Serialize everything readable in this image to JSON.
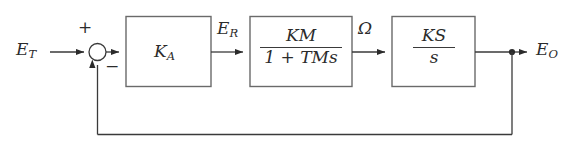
{
  "diagram": {
    "type": "control-system-block-diagram",
    "background_color": "#ffffff",
    "line_color": "#3a3a3a",
    "text_color": "#2b2b2b",
    "signals": {
      "input": {
        "base": "E",
        "sub": "T",
        "text": "E_T"
      },
      "after_amplifier": {
        "base": "E",
        "sub": "R",
        "text": "E_R"
      },
      "after_motor": {
        "base": "Ω",
        "sub": "",
        "text": "Ω"
      },
      "output": {
        "base": "E",
        "sub": "O",
        "text": "E_O"
      }
    },
    "summing_junction": {
      "name": "summing-junction",
      "plus_sign": "+",
      "minus_sign": "−"
    },
    "blocks": [
      {
        "id": "amplifier",
        "kind": "gain",
        "base": "K",
        "sub": "A",
        "text": "K_A"
      },
      {
        "id": "motor",
        "kind": "transfer-function",
        "numerator_base": "K",
        "numerator_sub": "M",
        "numerator_text": "K_M",
        "denominator_text": "1 + T_M s",
        "denominator_lead": "1 + T",
        "denominator_sub": "M",
        "denominator_tail": "s"
      },
      {
        "id": "integrator",
        "kind": "transfer-function",
        "numerator_base": "K",
        "numerator_sub": "S",
        "numerator_text": "K_S",
        "denominator_text": "s"
      }
    ],
    "feedback": {
      "name": "unity-feedback-path",
      "description": "output tapped and returned to minus input of summing junction"
    }
  }
}
